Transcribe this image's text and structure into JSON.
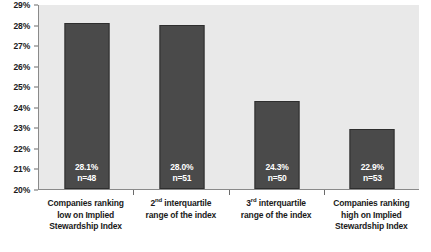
{
  "chart_data": {
    "type": "bar",
    "title": "",
    "subtitle": "",
    "xlabel": "",
    "ylabel": "",
    "ylim": [
      20,
      29
    ],
    "ytick_step": 1,
    "grid": false,
    "legend": "none",
    "axis_tick_labels": [
      "29%",
      "28%",
      "27%",
      "26%",
      "25%",
      "24%",
      "23%",
      "22%",
      "21%",
      "20%"
    ],
    "categories": [
      "Companies ranking low on Implied Stewardship Index",
      "2nd interquartile range of the index",
      "3rd interquartile range of the index",
      "Companies ranking high on Implied Stewardship Index"
    ],
    "category_label_lines": [
      [
        "Companies ranking",
        "low on Implied",
        "Stewardship Index"
      ],
      [
        "2|nd| interquartile",
        "range of the index"
      ],
      [
        "3|rd| interquartile",
        "range of the index"
      ],
      [
        "Companies ranking",
        "high on Implied",
        "Stewardship Index"
      ]
    ],
    "values": [
      28.1,
      28.0,
      24.3,
      22.9
    ],
    "value_labels": [
      "28.1%",
      "28.0%",
      "24.3%",
      "22.9%"
    ],
    "counts": [
      48,
      51,
      50,
      53
    ],
    "count_labels": [
      "n=48",
      "n=51",
      "n=50",
      "n=53"
    ],
    "colors": {
      "bar_fill": "#4a4a4a",
      "bar_border": "#2e2e2e",
      "plot_background": "#e9e9e9",
      "axis_line": "#8a8a8a",
      "text": "#1a1a1a",
      "bar_label_text": "#ffffff",
      "page_background": "#ffffff"
    }
  }
}
